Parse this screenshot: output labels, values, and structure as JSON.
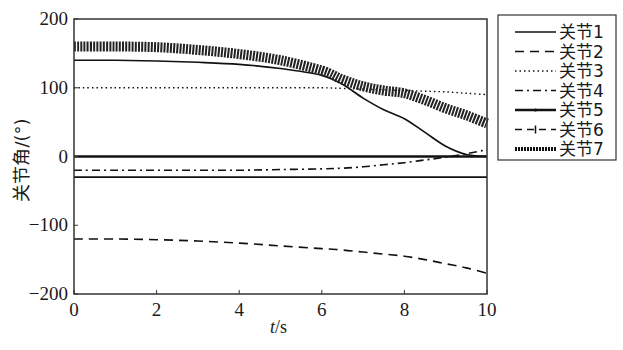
{
  "chart_data": {
    "type": "line",
    "title": "",
    "xlabel": "t/s",
    "ylabel": "关节角/(°)",
    "xlim": [
      0,
      10
    ],
    "ylim": [
      -200,
      200
    ],
    "xticks": [
      0,
      2,
      4,
      6,
      8,
      10
    ],
    "yticks": [
      -200,
      -100,
      0,
      100,
      200
    ],
    "xtick_labels": [
      "0",
      "2",
      "4",
      "6",
      "8",
      "10"
    ],
    "ytick_labels": [
      "−200",
      "−100",
      "0",
      "100",
      "200"
    ],
    "grid": false,
    "legend_position": "outside right, top",
    "x": [
      0,
      1,
      2,
      3,
      4,
      5,
      6,
      6.5,
      7,
      7.5,
      8,
      8.5,
      9,
      9.5,
      10
    ],
    "series": [
      {
        "name": "关节1",
        "style": "solid",
        "values": [
          140,
          140,
          139,
          137,
          134,
          128,
          118,
          105,
          85,
          68,
          55,
          35,
          15,
          3,
          0
        ]
      },
      {
        "name": "关节2",
        "style": "dashed",
        "values": [
          -120,
          -120,
          -121,
          -123,
          -126,
          -130,
          -134,
          -136,
          -139,
          -142,
          -145,
          -150,
          -156,
          -162,
          -170
        ]
      },
      {
        "name": "关节3",
        "style": "dotted",
        "values": [
          100,
          100,
          100,
          100,
          100,
          100,
          100,
          99,
          98,
          97,
          96,
          95,
          94,
          92,
          90
        ]
      },
      {
        "name": "关节4",
        "style": "dash-dot",
        "values": [
          -20,
          -20,
          -20,
          -20,
          -20,
          -19,
          -18,
          -17,
          -15,
          -12,
          -9,
          -5,
          -1,
          4,
          10
        ]
      },
      {
        "name": "关节5",
        "style": "solid-point",
        "values": [
          0,
          0,
          0,
          0,
          0,
          0,
          0,
          0,
          0,
          0,
          0,
          0,
          0,
          0,
          0
        ]
      },
      {
        "name": "关节6",
        "style": "dash-plus",
        "values": [
          -30,
          -30,
          -30,
          -30,
          -30,
          -30,
          -30,
          -30,
          -30,
          -30,
          -30,
          -30,
          -30,
          -30,
          -30
        ]
      },
      {
        "name": "关节7",
        "style": "thick-dotted",
        "values": [
          160,
          160,
          159,
          155,
          149,
          140,
          125,
          112,
          102,
          96,
          92,
          82,
          70,
          60,
          48
        ]
      }
    ]
  },
  "legend": {
    "items": [
      "关节1",
      "关节2",
      "关节3",
      "关节4",
      "关节5",
      "关节6",
      "关节7"
    ]
  },
  "axes": {
    "xlabel_italic": "t",
    "xlabel_unit": "/s",
    "ylabel": "关节角/(°)"
  }
}
